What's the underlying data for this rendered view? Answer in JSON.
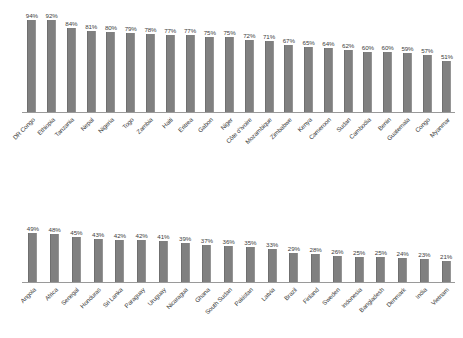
{
  "chart_data": [
    {
      "type": "bar",
      "title": "",
      "xlabel": "",
      "ylabel": "",
      "ylim": [
        0,
        100
      ],
      "grid": false,
      "legend": false,
      "value_suffix": "%",
      "bar_color": "#808080",
      "axis_color": "#9a9a9a",
      "categories": [
        "DR Congo",
        "Ethiopia",
        "Tanzania",
        "Nepal",
        "Nigeria",
        "Togo",
        "Zambia",
        "Haiti",
        "Eritrea",
        "Gabon",
        "Niger",
        "Côte d'Ivoire",
        "Mozambique",
        "Zimbabwe",
        "Kenya",
        "Cameroon",
        "Sudan",
        "Cambodia",
        "Benin",
        "Guatemala",
        "Congo",
        "Myanmar"
      ],
      "values": [
        94,
        92,
        84,
        81,
        80,
        79,
        78,
        77,
        77,
        75,
        75,
        72,
        71,
        67,
        65,
        64,
        62,
        60,
        60,
        59,
        57,
        51
      ],
      "labels": [
        "94%",
        "92%",
        "84%",
        "81%",
        "80%",
        "79%",
        "78%",
        "77%",
        "77%",
        "75%",
        "75%",
        "72%",
        "71%",
        "67%",
        "65%",
        "64%",
        "62%",
        "60%",
        "60%",
        "59%",
        "57%",
        "51%"
      ]
    },
    {
      "type": "bar",
      "title": "",
      "xlabel": "",
      "ylabel": "",
      "ylim": [
        0,
        100
      ],
      "grid": false,
      "legend": false,
      "value_suffix": "%",
      "bar_color": "#808080",
      "axis_color": "#9a9a9a",
      "categories": [
        "Angola",
        "Africa",
        "Senegal",
        "Honduras",
        "Sri Lanka",
        "Paraguay",
        "Uruguay",
        "Nicaragua",
        "Ghana",
        "South Sudan",
        "Pakistan",
        "Latvia",
        "Brazil",
        "Finland",
        "Sweden",
        "Indonesia",
        "Bangladesh",
        "Denmark",
        "India",
        "Vietnam"
      ],
      "values": [
        49,
        48,
        45,
        43,
        42,
        42,
        41,
        39,
        37,
        36,
        35,
        33,
        29,
        28,
        26,
        25,
        25,
        24,
        23,
        21
      ],
      "labels": [
        "49%",
        "48%",
        "45%",
        "43%",
        "42%",
        "42%",
        "41%",
        "39%",
        "37%",
        "36%",
        "35%",
        "33%",
        "29%",
        "28%",
        "26%",
        "25%",
        "25%",
        "24%",
        "23%",
        "21%"
      ]
    }
  ]
}
